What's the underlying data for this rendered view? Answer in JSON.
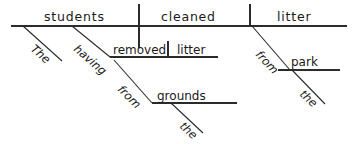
{
  "diagram": {
    "type": "reed-kellogg-sentence-diagram",
    "sentence": "The students, having removed litter from the grounds, cleaned litter next from the park.",
    "baseline": {
      "subject": "students",
      "verb": "cleaned",
      "object": "litter"
    },
    "modifiers": {
      "subject_article": "The",
      "participle": "having",
      "participle_verb": "removed",
      "participle_object": "litter",
      "participle_prep": "from",
      "participle_prep_object": "grounds",
      "participle_prep_object_article": "the",
      "verb_adverb": "next",
      "verb_prep": "from",
      "verb_prep_object": "park",
      "verb_prep_object_article": "the"
    },
    "words": {
      "students": "students",
      "cleaned": "cleaned",
      "litter_object": "litter",
      "the_subject": "The",
      "having": "having",
      "removed": "removed",
      "litter_participle_object": "litter",
      "from_participle": "from",
      "grounds": "grounds",
      "the_grounds": "the",
      "next": "next",
      "from_verb": "from",
      "park": "park",
      "the_park": "the"
    },
    "colors": {
      "line": "#2b2b2b",
      "text": "#1a1a1a",
      "background": "#ffffff"
    }
  }
}
